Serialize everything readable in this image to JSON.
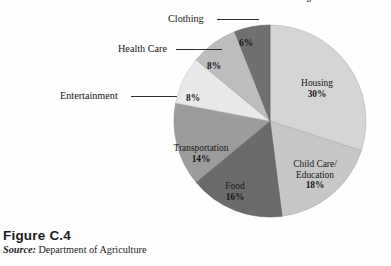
{
  "figure": {
    "number_label": "Figure  C.4",
    "source_prefix": "Source:",
    "source_text": " Department of Agriculture"
  },
  "chart_data": {
    "type": "pie",
    "title": "Breakdown of the Cost of Raising a Child",
    "xlabel": "",
    "ylabel": "",
    "legend_position": "callout-labels",
    "grid": false,
    "units": "percent",
    "total": 100,
    "categories": [
      "Housing",
      "Child Care/Education",
      "Food",
      "Transportation",
      "Entertainment",
      "Health Care",
      "Clothing"
    ],
    "values": [
      30,
      18,
      16,
      14,
      8,
      8,
      6
    ],
    "colors": [
      "#d5d5d5",
      "#c7c7c7",
      "#6b6b6b",
      "#9c9c9c",
      "#e9e9e9",
      "#bdbdbd",
      "#707070"
    ],
    "slices": [
      {
        "name": "Housing",
        "name_line1": "Housing",
        "name_line2": "",
        "value": 30,
        "percent_label": "30%",
        "color": "#d5d5d5",
        "label_placement": "inside"
      },
      {
        "name": "Child Care/Education",
        "name_line1": "Child Care/",
        "name_line2": "Education",
        "value": 18,
        "percent_label": "18%",
        "color": "#c7c7c7",
        "label_placement": "inside"
      },
      {
        "name": "Food",
        "name_line1": "Food",
        "name_line2": "",
        "value": 16,
        "percent_label": "16%",
        "color": "#6b6b6b",
        "label_placement": "inside"
      },
      {
        "name": "Transportation",
        "name_line1": "Transportation",
        "name_line2": "",
        "value": 14,
        "percent_label": "14%",
        "color": "#9c9c9c",
        "label_placement": "inside"
      },
      {
        "name": "Entertainment",
        "name_line1": "",
        "name_line2": "",
        "value": 8,
        "percent_label": "8%",
        "color": "#e9e9e9",
        "label_placement": "callout"
      },
      {
        "name": "Health Care",
        "name_line1": "",
        "name_line2": "",
        "value": 8,
        "percent_label": "8%",
        "color": "#bdbdbd",
        "label_placement": "callout"
      },
      {
        "name": "Clothing",
        "name_line1": "",
        "name_line2": "",
        "value": 6,
        "percent_label": "6%",
        "color": "#707070",
        "label_placement": "callout"
      }
    ],
    "callouts": [
      {
        "label": "Clothing",
        "percent_label": "6%"
      },
      {
        "label": "Health Care",
        "percent_label": "8%"
      },
      {
        "label": "Entertainment",
        "percent_label": "8%"
      }
    ]
  }
}
